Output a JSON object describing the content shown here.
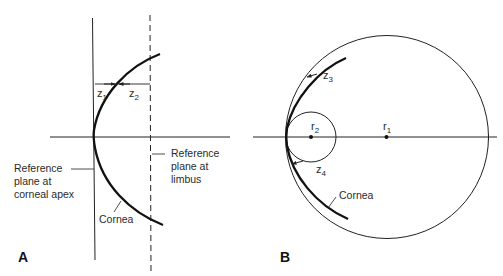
{
  "figure": {
    "panel_a": {
      "label": "A",
      "labels": {
        "ref_apex": "Reference\nplane at\ncorneal apex",
        "ref_limbus": "Reference\nplane at\nlimbus",
        "cornea": "Cornea"
      },
      "variables": {
        "z1": {
          "base": "z",
          "sub": "1"
        },
        "z2": {
          "base": "z",
          "sub": "2"
        }
      }
    },
    "panel_b": {
      "label": "B",
      "labels": {
        "cornea": "Cornea"
      },
      "variables": {
        "z3": {
          "base": "z",
          "sub": "3"
        },
        "z4": {
          "base": "z",
          "sub": "4"
        },
        "r1": {
          "base": "r",
          "sub": "1"
        },
        "r2": {
          "base": "r",
          "sub": "2"
        }
      }
    },
    "colors": {
      "line": "#222222",
      "background": "#ffffff"
    }
  }
}
